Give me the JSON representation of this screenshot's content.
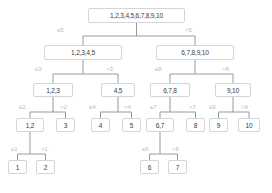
{
  "diagram": {
    "colors": {
      "node_border": "#d2d5d9",
      "node_fill": "#ffffff",
      "node_text": "#3c4043",
      "edge_line": "#8a8f94",
      "edge_label_text": "#b6babf",
      "background": "#ffffff"
    },
    "nodes": [
      {
        "id": "root",
        "label": "1,2,3,4,5,6,7,8,9,10",
        "x": 88,
        "y": 8,
        "w": 97,
        "h": 15,
        "fs": 6.6
      },
      {
        "id": "l1a",
        "label": "1,2,3,4,5",
        "x": 44,
        "y": 45,
        "w": 78,
        "h": 15,
        "fs": 6.6
      },
      {
        "id": "l1b",
        "label": "6,7,8,9,10",
        "x": 156,
        "y": 45,
        "w": 78,
        "h": 15,
        "fs": 6.6
      },
      {
        "id": "l2a",
        "label": "1,2,3",
        "x": 33,
        "y": 83,
        "w": 40,
        "h": 14,
        "fs": 6.6
      },
      {
        "id": "l2b",
        "label": "4,5",
        "x": 101,
        "y": 83,
        "w": 34,
        "h": 14,
        "fs": 6.6
      },
      {
        "id": "l2c",
        "label": "6,7,8",
        "x": 150,
        "y": 83,
        "w": 40,
        "h": 14,
        "fs": 6.6
      },
      {
        "id": "l2d",
        "label": "9,10",
        "x": 215,
        "y": 83,
        "w": 36,
        "h": 14,
        "fs": 6.6
      },
      {
        "id": "l3a",
        "label": "1,2",
        "x": 16,
        "y": 118,
        "w": 28,
        "h": 14,
        "fs": 6.6
      },
      {
        "id": "l3b",
        "label": "3",
        "x": 56,
        "y": 118,
        "w": 19,
        "h": 14,
        "fs": 6.6
      },
      {
        "id": "l3c",
        "label": "4",
        "x": 91,
        "y": 118,
        "w": 19,
        "h": 14,
        "fs": 6.6
      },
      {
        "id": "l3d",
        "label": "5",
        "x": 122,
        "y": 118,
        "w": 19,
        "h": 14,
        "fs": 6.6
      },
      {
        "id": "l3e",
        "label": "6,7",
        "x": 146,
        "y": 118,
        "w": 28,
        "h": 14,
        "fs": 6.6
      },
      {
        "id": "l3f",
        "label": "8",
        "x": 186,
        "y": 118,
        "w": 19,
        "h": 14,
        "fs": 6.6
      },
      {
        "id": "l3g",
        "label": "9",
        "x": 209,
        "y": 118,
        "w": 19,
        "h": 14,
        "fs": 6.6
      },
      {
        "id": "l3h",
        "label": "10",
        "x": 238,
        "y": 118,
        "w": 22,
        "h": 14,
        "fs": 6.6
      },
      {
        "id": "l4a",
        "label": "1",
        "x": 8,
        "y": 160,
        "w": 19,
        "h": 14,
        "fs": 6.6
      },
      {
        "id": "l4b",
        "label": "2",
        "x": 36,
        "y": 160,
        "w": 19,
        "h": 14,
        "fs": 6.6
      },
      {
        "id": "l4c",
        "label": "6",
        "x": 140,
        "y": 160,
        "w": 19,
        "h": 14,
        "fs": 6.6
      },
      {
        "id": "l4d",
        "label": "7",
        "x": 168,
        "y": 160,
        "w": 19,
        "h": 14,
        "fs": 6.6
      }
    ],
    "edge_labels": [
      {
        "id": "e-root-left",
        "text": "≤5",
        "x": 57,
        "y": 27,
        "fs": 6.0
      },
      {
        "id": "e-root-right",
        "text": ">5",
        "x": 185,
        "y": 27,
        "fs": 6.0
      },
      {
        "id": "e-l1a-left",
        "text": "≤3",
        "x": 35,
        "y": 66,
        "fs": 6.0
      },
      {
        "id": "e-l1a-right",
        "text": ">3",
        "x": 106,
        "y": 66,
        "fs": 6.0
      },
      {
        "id": "e-l1b-left",
        "text": "≤8",
        "x": 155,
        "y": 66,
        "fs": 6.0
      },
      {
        "id": "e-l1b-right",
        "text": ">8",
        "x": 222,
        "y": 66,
        "fs": 6.0
      },
      {
        "id": "e-l2a-left",
        "text": "≤2",
        "x": 19,
        "y": 104,
        "fs": 6.0
      },
      {
        "id": "e-l2a-right",
        "text": ">2",
        "x": 60,
        "y": 104,
        "fs": 6.0
      },
      {
        "id": "e-l2b-left",
        "text": "≤4",
        "x": 89,
        "y": 104,
        "fs": 6.0
      },
      {
        "id": "e-l2b-right",
        "text": ">4",
        "x": 124,
        "y": 104,
        "fs": 6.0
      },
      {
        "id": "e-l2c-left",
        "text": "≤7",
        "x": 150,
        "y": 104,
        "fs": 6.0
      },
      {
        "id": "e-l2c-right",
        "text": ">7",
        "x": 189,
        "y": 104,
        "fs": 6.0
      },
      {
        "id": "e-l2d-left",
        "text": "≤9",
        "x": 209,
        "y": 104,
        "fs": 6.0
      },
      {
        "id": "e-l2d-right",
        "text": ">9",
        "x": 241,
        "y": 104,
        "fs": 6.0
      },
      {
        "id": "e-l3a-left",
        "text": "≤1",
        "x": 11,
        "y": 146,
        "fs": 6.0
      },
      {
        "id": "e-l3a-right",
        "text": ">1",
        "x": 41,
        "y": 146,
        "fs": 6.0
      },
      {
        "id": "e-l3e-left",
        "text": "≤6",
        "x": 142,
        "y": 146,
        "fs": 6.0
      },
      {
        "id": "e-l3e-right",
        "text": ">6",
        "x": 172,
        "y": 146,
        "fs": 6.0
      }
    ],
    "connectors": [
      {
        "id": "c-root",
        "parent_x": 136.5,
        "parent_bottom": 23,
        "child_top": 45,
        "left_x": 83,
        "right_x": 195,
        "mid_y": 36
      },
      {
        "id": "c-l1a",
        "parent_x": 83,
        "parent_bottom": 60,
        "child_top": 83,
        "left_x": 53,
        "right_x": 118,
        "mid_y": 74
      },
      {
        "id": "c-l1b",
        "parent_x": 195,
        "parent_bottom": 60,
        "child_top": 83,
        "left_x": 170,
        "right_x": 233,
        "mid_y": 74
      },
      {
        "id": "c-l2a",
        "parent_x": 53,
        "parent_bottom": 97,
        "child_top": 118,
        "left_x": 30,
        "right_x": 65.5,
        "mid_y": 112
      },
      {
        "id": "c-l2b",
        "parent_x": 118,
        "parent_bottom": 97,
        "child_top": 118,
        "left_x": 100.5,
        "right_x": 131.5,
        "mid_y": 112
      },
      {
        "id": "c-l2c",
        "parent_x": 170,
        "parent_bottom": 97,
        "child_top": 118,
        "left_x": 160,
        "right_x": 195.5,
        "mid_y": 112
      },
      {
        "id": "c-l2d",
        "parent_x": 233,
        "parent_bottom": 97,
        "child_top": 118,
        "left_x": 218.5,
        "right_x": 249,
        "mid_y": 112
      },
      {
        "id": "c-l3a",
        "parent_x": 30,
        "parent_bottom": 132,
        "child_top": 160,
        "left_x": 17.5,
        "right_x": 45.5,
        "mid_y": 154
      },
      {
        "id": "c-l3e",
        "parent_x": 160,
        "parent_bottom": 132,
        "child_top": 160,
        "left_x": 149.5,
        "right_x": 177.5,
        "mid_y": 154
      }
    ]
  }
}
